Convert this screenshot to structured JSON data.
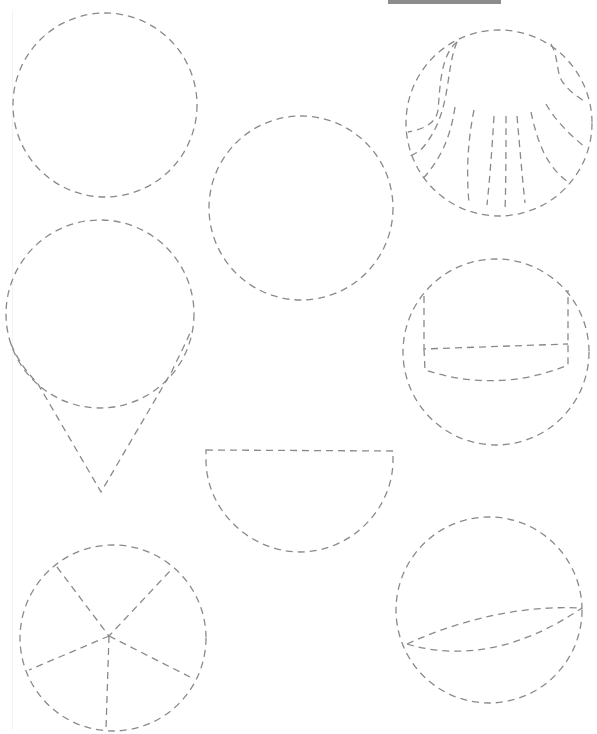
{
  "page": {
    "width": 597,
    "height": 734,
    "background": "#ffffff",
    "stroke_color": "#8a8a8a",
    "top_bar_color": "#8c8c8c"
  },
  "shapes": [
    {
      "name": "plain-circle-top-left",
      "type": "circle",
      "cx": 105,
      "cy": 105,
      "r": 92
    },
    {
      "name": "plain-circle-center",
      "type": "circle",
      "cx": 301,
      "cy": 208,
      "r": 92
    },
    {
      "name": "shell-circle",
      "type": "circle",
      "cx": 499,
      "cy": 123,
      "r": 93,
      "paths": [
        "M 457 42 C 440 55, 440 90, 438 110 C 436 125, 420 130, 408 132",
        "M 457 42 C 445 70, 452 110, 425 145 C 420 152, 412 155, 410 156",
        "M 455 107 C 450 140, 440 160, 420 182",
        "M 474 110 C 468 140, 466 170, 469 203",
        "M 494 116 C 492 150, 490 175, 487 205",
        "M 506 116 C 506 150, 506 180, 505 212",
        "M 517 116 C 520 150, 522 175, 525 203",
        "M 531 112 C 537 140, 545 165, 568 182",
        "M 546 104 C 555 120, 570 135, 585 147",
        "M 551 44 C 560 60, 555 75, 565 85 C 570 92, 580 98, 585 102"
      ]
    },
    {
      "name": "ice-cream-scoop",
      "type": "circle",
      "cx": 100,
      "cy": 314,
      "r": 94,
      "paths": [
        "M 11 344 C 20 365, 30 375, 38 384 L 101 492 L 172 371 C 178 358, 185 345, 190 333"
      ]
    },
    {
      "name": "bucket-circle",
      "type": "circle",
      "cx": 496,
      "cy": 352,
      "r": 93,
      "paths": [
        "M 424 296 L 424 349 L 568 344",
        "M 424 349 L 425 370 C 470 385, 520 385, 568 365 L 568 344 L 568 290"
      ]
    },
    {
      "name": "half-circle",
      "type": "path",
      "paths": [
        "M 206 450 L 393 451 L 393 460 C 393 510, 350 552, 300 552 C 250 552, 206 510, 206 460 Z"
      ]
    },
    {
      "name": "pie-circle",
      "type": "circle",
      "cx": 113,
      "cy": 638,
      "r": 93,
      "paths": [
        "M 57 567 L 109 636 L 170 571",
        "M 109 636 L 29 670",
        "M 109 636 L 190 677",
        "M 109 636 L 106 729"
      ]
    },
    {
      "name": "sphere-circle",
      "type": "circle",
      "cx": 489,
      "cy": 610,
      "r": 93,
      "paths": [
        "M 407 644 C 460 620, 520 605, 582 608",
        "M 407 644 C 460 660, 520 650, 582 608"
      ]
    }
  ]
}
